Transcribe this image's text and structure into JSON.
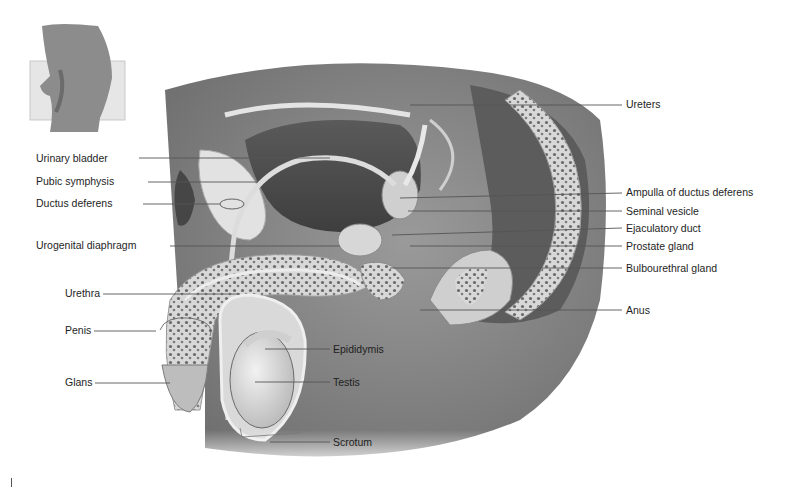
{
  "figure": {
    "type": "labeled anatomical illustration",
    "orientation_inset": "side view of torso with section plane"
  },
  "labels_left": [
    {
      "id": "urinary-bladder",
      "text": "Urinary bladder",
      "x": 36,
      "y": 158,
      "line": [
        [
          139,
          158
        ],
        [
          330,
          158
        ]
      ]
    },
    {
      "id": "pubic-symphysis",
      "text": "Pubic symphysis",
      "x": 36,
      "y": 181,
      "line": [
        [
          148,
          182
        ],
        [
          258,
          182
        ]
      ]
    },
    {
      "id": "ductus-deferens",
      "text": "Ductus deferens",
      "x": 36,
      "y": 203,
      "line": [
        [
          143,
          204
        ],
        [
          220,
          204
        ]
      ]
    },
    {
      "id": "urogenital-diaphragm",
      "text": "Urogenital diaphragm",
      "x": 36,
      "y": 245,
      "line": [
        [
          170,
          246
        ],
        [
          340,
          246
        ]
      ]
    },
    {
      "id": "urethra",
      "text": "Urethra",
      "x": 65,
      "y": 293,
      "line": [
        [
          103,
          294
        ],
        [
          240,
          294
        ]
      ]
    },
    {
      "id": "penis",
      "text": "Penis",
      "x": 65,
      "y": 330,
      "line": [
        [
          94,
          331
        ],
        [
          156,
          331
        ]
      ]
    },
    {
      "id": "glans",
      "text": "Glans",
      "x": 65,
      "y": 382,
      "line": [
        [
          95,
          383
        ],
        [
          170,
          383
        ]
      ]
    }
  ],
  "labels_right": [
    {
      "id": "ureters",
      "text": "Ureters",
      "x": 626,
      "y": 104,
      "line": [
        [
          410,
          105
        ],
        [
          622,
          105
        ]
      ]
    },
    {
      "id": "ampulla-of-ductus-deferens",
      "text": "Ampulla of ductus deferens",
      "x": 626,
      "y": 192,
      "line": [
        [
          400,
          198
        ],
        [
          622,
          193
        ]
      ]
    },
    {
      "id": "seminal-vesicle",
      "text": "Seminal vesicle",
      "x": 626,
      "y": 211,
      "line": [
        [
          408,
          211
        ],
        [
          622,
          211
        ]
      ]
    },
    {
      "id": "ejaculatory-duct",
      "text": "Ejaculatory duct",
      "x": 626,
      "y": 228,
      "line": [
        [
          392,
          235
        ],
        [
          622,
          228
        ]
      ]
    },
    {
      "id": "prostate-gland",
      "text": "Prostate gland",
      "x": 626,
      "y": 246,
      "line": [
        [
          410,
          246
        ],
        [
          622,
          246
        ]
      ]
    },
    {
      "id": "bulbourethral-gland",
      "text": "Bulbourethral gland",
      "x": 626,
      "y": 268,
      "line": [
        [
          390,
          268
        ],
        [
          622,
          268
        ]
      ]
    },
    {
      "id": "anus",
      "text": "Anus",
      "x": 626,
      "y": 310,
      "line": [
        [
          420,
          310
        ],
        [
          622,
          310
        ]
      ]
    }
  ],
  "labels_center": [
    {
      "id": "epididymis",
      "text": "Epididymis",
      "x": 333,
      "y": 349,
      "line": [
        [
          265,
          349
        ],
        [
          330,
          349
        ]
      ]
    },
    {
      "id": "testis",
      "text": "Testis",
      "x": 333,
      "y": 382,
      "line": [
        [
          255,
          382
        ],
        [
          330,
          382
        ]
      ]
    },
    {
      "id": "scrotum",
      "text": "Scrotum",
      "x": 333,
      "y": 442,
      "line": [
        [
          270,
          442
        ],
        [
          330,
          442
        ]
      ]
    }
  ],
  "colors": {
    "background": "#ffffff",
    "label_text": "#1e1e1e",
    "leader_line": "#555555",
    "body_gray": "#8a8a8a",
    "dark_tissue": "#4a4a4a",
    "light_tissue": "#d6d6d6"
  }
}
